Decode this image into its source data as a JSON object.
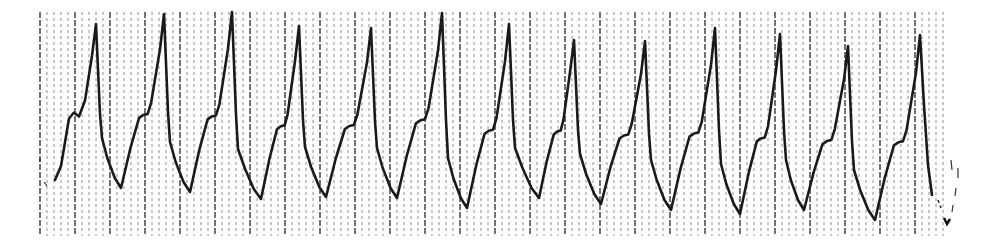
{
  "chart_data": {
    "type": "line",
    "title": "",
    "xlabel": "",
    "ylabel": "",
    "description": "Scanned rhythm strip: regular tall narrow peaked complexes with a notched shoulder on each upstroke, on a vertical-line grid",
    "grid": {
      "on": true,
      "orientation": "vertical",
      "x_start": 40,
      "x_end": 945,
      "minor_spacing_px": 7,
      "major_every": 5,
      "y_top": 12,
      "y_bottom": 236,
      "color": "#333333"
    },
    "trace_color": "#1a1a1a",
    "peaks": [
      {
        "x": 96,
        "y": 24
      },
      {
        "x": 164,
        "y": 14
      },
      {
        "x": 232,
        "y": 12
      },
      {
        "x": 299,
        "y": 26
      },
      {
        "x": 371,
        "y": 28
      },
      {
        "x": 442,
        "y": 13
      },
      {
        "x": 509,
        "y": 24
      },
      {
        "x": 574,
        "y": 40
      },
      {
        "x": 645,
        "y": 41
      },
      {
        "x": 715,
        "y": 28
      },
      {
        "x": 780,
        "y": 34
      },
      {
        "x": 848,
        "y": 46
      },
      {
        "x": 920,
        "y": 35
      }
    ],
    "troughs": [
      {
        "x": 121,
        "y": 188
      },
      {
        "x": 190,
        "y": 192
      },
      {
        "x": 261,
        "y": 199
      },
      {
        "x": 326,
        "y": 197
      },
      {
        "x": 397,
        "y": 198
      },
      {
        "x": 467,
        "y": 208
      },
      {
        "x": 539,
        "y": 198
      },
      {
        "x": 601,
        "y": 204
      },
      {
        "x": 671,
        "y": 210
      },
      {
        "x": 740,
        "y": 214
      },
      {
        "x": 804,
        "y": 210
      },
      {
        "x": 875,
        "y": 220
      }
    ],
    "start_point": {
      "x": 55,
      "y": 180
    },
    "end_point": {
      "x": 932,
      "y": 195
    },
    "cycle_count": 13,
    "approx_cycle_length_px": 69
  }
}
